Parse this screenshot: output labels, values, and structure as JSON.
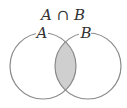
{
  "diagram": {
    "title": "A ∩ B",
    "sets": [
      {
        "label": "A",
        "cx": 43,
        "cy": 66,
        "r": 33
      },
      {
        "label": "B",
        "cx": 88,
        "cy": 66,
        "r": 33
      }
    ],
    "shaded_region": "intersection",
    "colors": {
      "stroke": "#8a8a8a",
      "shade": "#cfcfcf",
      "text": "#333333",
      "background": "#ffffff"
    }
  }
}
